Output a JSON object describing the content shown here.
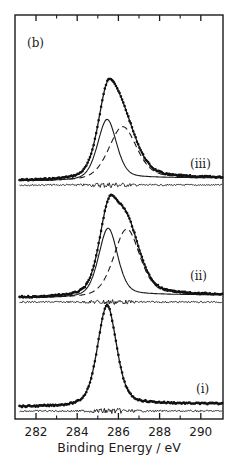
{
  "chart_data": {
    "type": "line",
    "title": "",
    "panel_label": "(b)",
    "xlabel": "Binding Energy / eV",
    "ylabel": "",
    "xlim": [
      281.0,
      291.1
    ],
    "xticks": [
      282,
      284,
      286,
      288,
      290
    ],
    "xtick_labels": [
      "282",
      "284",
      "286",
      "288",
      "290"
    ],
    "minor_xticks": [
      283,
      285,
      287,
      289
    ],
    "grid": false,
    "legend": null,
    "y_axis_ticks": false,
    "colors": {
      "line": "#1a1a1a",
      "background": "#ffffff"
    },
    "spectra": [
      {
        "label": "(iii)",
        "offset_order": 3,
        "envelope": {
          "peak_position_eV": 285.6,
          "relative_height": 1.0,
          "fwhm_eV": 1.8
        },
        "components": [
          {
            "style": "solid",
            "position_eV": 285.45,
            "relative_height": 0.6,
            "fwhm_eV": 1.1
          },
          {
            "style": "dashed",
            "position_eV": 286.2,
            "relative_height": 0.52,
            "fwhm_eV": 1.6
          }
        ],
        "has_data_points": true,
        "has_residual": true
      },
      {
        "label": "(ii)",
        "offset_order": 2,
        "envelope": {
          "peak_position_eV": 285.6,
          "relative_height": 1.0,
          "fwhm_eV": 1.8
        },
        "components": [
          {
            "style": "solid",
            "position_eV": 285.5,
            "relative_height": 0.68,
            "fwhm_eV": 1.1
          },
          {
            "style": "dashed",
            "position_eV": 286.4,
            "relative_height": 0.66,
            "fwhm_eV": 1.5
          }
        ],
        "has_data_points": true,
        "has_residual": true
      },
      {
        "label": "(i)",
        "offset_order": 1,
        "envelope": {
          "peak_position_eV": 285.45,
          "relative_height": 1.0,
          "fwhm_eV": 1.1
        },
        "components": [
          {
            "style": "solid",
            "position_eV": 285.45,
            "relative_height": 1.0,
            "fwhm_eV": 1.1
          }
        ],
        "has_data_points": true,
        "has_residual": true
      }
    ]
  },
  "layout": {
    "frame": {
      "left": 15,
      "top": 15,
      "right": 223,
      "bottom": 419
    },
    "x_px_per_eV": 20.6,
    "x_origin_eV": 282,
    "x_origin_px": 36,
    "baselines_px": [
      181,
      298,
      407
    ],
    "peak_heights_px": [
      102,
      102,
      101
    ],
    "label_positions": [
      {
        "x": 190,
        "y": 168
      },
      {
        "x": 190,
        "y": 280
      },
      {
        "x": 196,
        "y": 393
      }
    ]
  }
}
